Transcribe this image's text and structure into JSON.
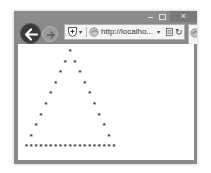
{
  "window": {
    "controls": {
      "minimize_icon": "minimize-icon",
      "maximize_icon": "maximize-icon",
      "close_label": "×"
    }
  },
  "navbar": {
    "back_icon": "back-arrow-icon",
    "forward_icon": "forward-arrow-icon",
    "address": {
      "url": "http://localho...",
      "shield_dropdown": "▾",
      "url_dropdown": "▾",
      "refresh_label": "↻"
    },
    "tab": {
      "favicon": "ie-page-icon"
    }
  },
  "content": {
    "pattern_char": "*",
    "rows": 10,
    "lines": [
      "         *",
      "        * *",
      "       *   *",
      "      *     *",
      "     *       *",
      "    *         *",
      "   *           *",
      "  *             *",
      " *               *",
      "*******************"
    ],
    "text_color": "#3a3a3a"
  },
  "colors": {
    "frame": "#8a8a8a",
    "close_button": "#7a7a7a",
    "back_button": "#3a3a3a",
    "address_bar": "#f4f4f4",
    "page_background": "#ffffff"
  }
}
